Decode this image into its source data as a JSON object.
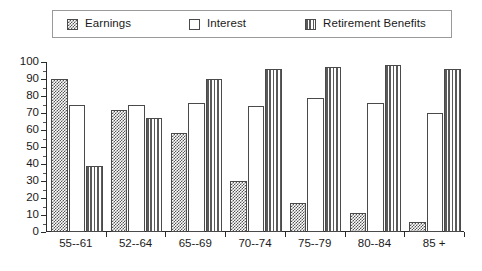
{
  "legend": {
    "items": [
      {
        "label": "Earnings",
        "pattern": "checker",
        "swatch_name": "legend-swatch-earnings"
      },
      {
        "label": "Interest",
        "pattern": "open",
        "swatch_name": "legend-swatch-interest"
      },
      {
        "label": "Retirement Benefits",
        "pattern": "vstripe",
        "swatch_name": "legend-swatch-retirement-benefits"
      }
    ]
  },
  "chart_data": {
    "type": "bar",
    "title": "",
    "xlabel": "",
    "ylabel": "",
    "ylim": [
      0,
      100
    ],
    "yticks": [
      0,
      10,
      20,
      30,
      40,
      50,
      60,
      70,
      80,
      90,
      100
    ],
    "grid": false,
    "legend_position": "top",
    "categories": [
      "55--61",
      "52--64",
      "65--69",
      "70--74",
      "75--79",
      "80--84",
      "85 +"
    ],
    "series": [
      {
        "name": "Earnings",
        "values": [
          90,
          72,
          58,
          30,
          17,
          11,
          6
        ]
      },
      {
        "name": "Interest",
        "values": [
          75,
          75,
          76,
          74,
          79,
          76,
          70
        ]
      },
      {
        "name": "Retirement Benefits",
        "values": [
          39,
          67,
          90,
          96,
          97,
          98,
          96
        ]
      }
    ]
  }
}
